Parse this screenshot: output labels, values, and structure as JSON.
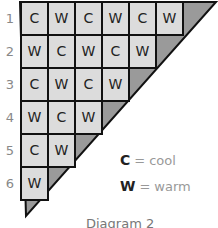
{
  "diagram": {
    "rows": [
      {
        "label": "1",
        "cells": [
          "C",
          "W",
          "C",
          "W",
          "C",
          "W"
        ]
      },
      {
        "label": "2",
        "cells": [
          "W",
          "C",
          "W",
          "C",
          "W"
        ]
      },
      {
        "label": "3",
        "cells": [
          "C",
          "W",
          "C",
          "W"
        ]
      },
      {
        "label": "4",
        "cells": [
          "W",
          "C",
          "W"
        ]
      },
      {
        "label": "5",
        "cells": [
          "C",
          "W"
        ]
      },
      {
        "label": "6",
        "cells": [
          "W"
        ]
      }
    ],
    "colors": {
      "cell_fill": "#dcdcdc",
      "shade_fill": "#9a9a9a",
      "line": "#111111"
    }
  },
  "legend": [
    {
      "key": "C",
      "eq": "=",
      "value": "cool"
    },
    {
      "key": "W",
      "eq": "=",
      "value": "warm"
    }
  ],
  "caption": "Diagram 2"
}
